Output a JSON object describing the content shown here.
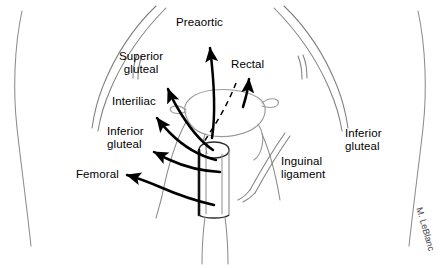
{
  "figure": {
    "colors": {
      "arrow": "#000000",
      "anatomy_outline": "#7a7a7a",
      "body_contour": "#8c8c8c",
      "organ_outline": "#9a9a9a",
      "background": "#ffffff",
      "text": "#000000",
      "signature": "#3a3a3a"
    }
  },
  "labels": [
    {
      "id": "preaortic",
      "text": "Preaortic",
      "x": 176,
      "y": 16,
      "align": "left"
    },
    {
      "id": "superior-gluteal",
      "text": "Superior\ngluteal",
      "x": 119,
      "y": 50,
      "align": "left"
    },
    {
      "id": "rectal",
      "text": "Rectal",
      "x": 231,
      "y": 58,
      "align": "left"
    },
    {
      "id": "interiliac",
      "text": "Interiliac",
      "x": 112,
      "y": 95,
      "align": "left"
    },
    {
      "id": "inferior-gluteal-left",
      "text": "Inferior\ngluteal",
      "x": 107,
      "y": 125,
      "align": "left"
    },
    {
      "id": "femoral",
      "text": "Femoral",
      "x": 76,
      "y": 168,
      "align": "left"
    },
    {
      "id": "inguinal-ligament",
      "text": "Inguinal\nligament",
      "x": 281,
      "y": 155,
      "align": "left"
    },
    {
      "id": "inferior-gluteal-right",
      "text": "Inferior\ngluteal",
      "x": 345,
      "y": 127,
      "align": "left"
    }
  ],
  "signature": {
    "text": "M. LeBlanc",
    "x": 424,
    "y": 206,
    "rotation_deg": 74
  },
  "anatomy": {
    "parts": [
      "left-body-contour",
      "right-body-contour",
      "left-iliac-crest",
      "right-iliac-crest",
      "uterus-body",
      "vaginal-cylinder",
      "vaginal-canal",
      "inguinal-ligament-lines",
      "rectal-dashed-path"
    ]
  },
  "arrows": [
    {
      "id": "arrow-preaortic",
      "target": "preaortic"
    },
    {
      "id": "arrow-rectal",
      "target": "rectal"
    },
    {
      "id": "arrow-superior-gluteal",
      "target": "superior-gluteal"
    },
    {
      "id": "arrow-interiliac",
      "target": "interiliac"
    },
    {
      "id": "arrow-inferior-gluteal",
      "target": "inferior-gluteal-left"
    },
    {
      "id": "arrow-femoral",
      "target": "femoral"
    }
  ]
}
